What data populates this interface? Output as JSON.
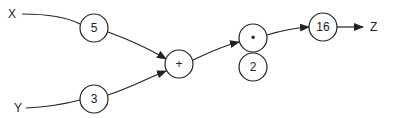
{
  "diagram": {
    "type": "computational-graph",
    "inputs": [
      {
        "id": "x",
        "label": "X"
      },
      {
        "id": "y",
        "label": "Y"
      }
    ],
    "output": {
      "id": "z",
      "label": "Z"
    },
    "nodes": [
      {
        "id": "n5",
        "label": "5"
      },
      {
        "id": "n3",
        "label": "3"
      },
      {
        "id": "add",
        "label": "+"
      },
      {
        "id": "mul",
        "label": "•"
      },
      {
        "id": "n2",
        "label": "2"
      },
      {
        "id": "n16",
        "label": "16"
      }
    ],
    "edges": [
      {
        "from": "x",
        "to": "n5"
      },
      {
        "from": "y",
        "to": "n3"
      },
      {
        "from": "n5",
        "to": "add"
      },
      {
        "from": "n3",
        "to": "add"
      },
      {
        "from": "add",
        "to": "mul"
      },
      {
        "from": "mul",
        "to": "n16"
      },
      {
        "from": "n16",
        "to": "z"
      }
    ],
    "colors": {
      "stroke": "#222222",
      "background": "#ffffff"
    }
  }
}
